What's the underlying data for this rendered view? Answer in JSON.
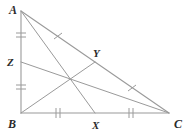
{
  "figure": {
    "kind": "triangle-medians-centroid",
    "background_color": "#ffffff",
    "line_color": "#9a9a9a",
    "label_color": "#2b2b2b"
  },
  "labels": {
    "A": "A",
    "B": "B",
    "C": "C",
    "X": "X",
    "Y": "Y",
    "Z": "Z"
  },
  "points": {
    "A": {
      "x": 21,
      "y": 11
    },
    "B": {
      "x": 21,
      "y": 113
    },
    "C": {
      "x": 169,
      "y": 113
    },
    "X": {
      "x": 95,
      "y": 113
    },
    "Y": {
      "x": 95,
      "y": 62
    },
    "Z": {
      "x": 21,
      "y": 62
    },
    "centroid": {
      "x": 70,
      "y": 79
    }
  },
  "label_positions": {
    "A": {
      "x": 9,
      "y": 14
    },
    "B": {
      "x": 8,
      "y": 128
    },
    "C": {
      "x": 174,
      "y": 128
    },
    "X": {
      "x": 92,
      "y": 129
    },
    "Y": {
      "x": 93,
      "y": 57
    },
    "Z": {
      "x": 7,
      "y": 66
    }
  },
  "segments": [
    {
      "name": "side-AB",
      "from": "A",
      "to": "B"
    },
    {
      "name": "side-BC",
      "from": "B",
      "to": "C"
    },
    {
      "name": "side-AC",
      "from": "A",
      "to": "C"
    },
    {
      "name": "median-AX",
      "from": "A",
      "to": "X"
    },
    {
      "name": "median-BY",
      "from": "B",
      "to": "Y"
    },
    {
      "name": "median-CZ",
      "from": "C",
      "to": "Z"
    }
  ],
  "tick_marks": [
    {
      "name": "tick-AZ",
      "segment": "AZ",
      "count": 2,
      "at": {
        "x": 21,
        "y": 36
      },
      "orientation": "horizontal"
    },
    {
      "name": "tick-ZB",
      "segment": "ZB",
      "count": 2,
      "at": {
        "x": 21,
        "y": 87
      },
      "orientation": "horizontal"
    },
    {
      "name": "tick-BX",
      "segment": "BX",
      "count": 2,
      "at": {
        "x": 58,
        "y": 113
      },
      "orientation": "vertical"
    },
    {
      "name": "tick-XC",
      "segment": "XC",
      "count": 2,
      "at": {
        "x": 131,
        "y": 113
      },
      "orientation": "vertical"
    },
    {
      "name": "tick-AY",
      "segment": "AY",
      "count": 1,
      "at": {
        "x": 58,
        "y": 36
      },
      "orientation": "perpendicular"
    },
    {
      "name": "tick-YC",
      "segment": "YC",
      "count": 1,
      "at": {
        "x": 132,
        "y": 88
      },
      "orientation": "perpendicular"
    }
  ]
}
